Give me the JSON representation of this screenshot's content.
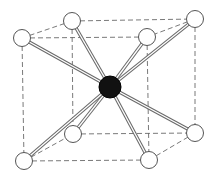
{
  "diagram": {
    "type": "body-centered-cubic-unit-cell",
    "colors": {
      "background": "#ffffff",
      "corner_atom_fill": "#ffffff",
      "corner_atom_stroke": "#555555",
      "center_atom_fill": "#111111",
      "bond_outer": "#6a6a6a",
      "bond_inner": "#ffffff",
      "edge_dash": "#6a6a6a"
    },
    "center_atom": {
      "id": "center",
      "x": 110,
      "y": 87,
      "r": 11
    },
    "corner_atoms": [
      {
        "id": "front-top-left",
        "x": 22,
        "y": 38,
        "r": 8.5
      },
      {
        "id": "back-top-left",
        "x": 72,
        "y": 21,
        "r": 8.5
      },
      {
        "id": "back-top-right",
        "x": 195,
        "y": 19,
        "r": 8.5
      },
      {
        "id": "front-top-right",
        "x": 147,
        "y": 37,
        "r": 8.5
      },
      {
        "id": "back-bottom-left",
        "x": 73,
        "y": 134,
        "r": 8.5
      },
      {
        "id": "front-bottom-left",
        "x": 24,
        "y": 161,
        "r": 8.5
      },
      {
        "id": "front-bottom-right",
        "x": 149,
        "y": 160,
        "r": 8.5
      },
      {
        "id": "back-bottom-right",
        "x": 195,
        "y": 133,
        "r": 8.5
      }
    ],
    "edges": [
      [
        "front-top-left",
        "back-top-left"
      ],
      [
        "back-top-left",
        "back-top-right"
      ],
      [
        "back-top-right",
        "front-top-right"
      ],
      [
        "front-top-right",
        "front-top-left"
      ],
      [
        "front-bottom-left",
        "back-bottom-left"
      ],
      [
        "back-bottom-left",
        "back-bottom-right"
      ],
      [
        "back-bottom-right",
        "front-bottom-right"
      ],
      [
        "front-bottom-right",
        "front-bottom-left"
      ],
      [
        "front-top-left",
        "front-bottom-left"
      ],
      [
        "back-top-left",
        "back-bottom-left"
      ],
      [
        "back-top-right",
        "back-bottom-right"
      ],
      [
        "front-top-right",
        "front-bottom-right"
      ]
    ],
    "bonds": [
      "front-top-left",
      "back-top-left",
      "back-top-right",
      "front-top-right",
      "back-bottom-left",
      "front-bottom-left",
      "front-bottom-right",
      "back-bottom-right"
    ]
  }
}
